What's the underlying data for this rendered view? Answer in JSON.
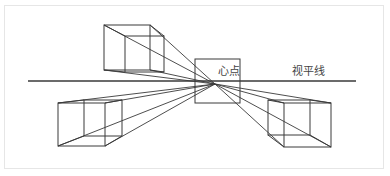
{
  "labels": {
    "vanishing_point": "心点",
    "horizon_line": "视平线"
  },
  "colors": {
    "line": "#3a3a3a",
    "frame": "#e6e6e6",
    "background": "#ffffff"
  },
  "geometry": {
    "vanishing_point": [
      215,
      84
    ],
    "horizon": {
      "x1": 28,
      "x2": 356,
      "y": 81
    },
    "center_box": {
      "x": 195,
      "y": 59,
      "w": 45,
      "h": 44
    },
    "cubes": [
      {
        "name": "top-left",
        "front": [
          104,
          25,
          150,
          70
        ],
        "back": [
          125,
          36,
          164,
          72
        ]
      },
      {
        "name": "bottom-left",
        "front": [
          58,
          103,
          105,
          146
        ],
        "back": [
          84,
          100,
          122,
          136
        ]
      },
      {
        "name": "bottom-right",
        "front": [
          284,
          103,
          331,
          147
        ],
        "back": [
          268,
          100,
          310,
          135
        ]
      }
    ]
  }
}
